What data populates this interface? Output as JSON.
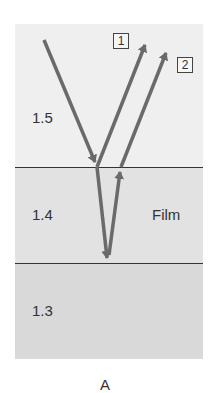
{
  "diagram": {
    "layers": [
      {
        "name": "top-medium",
        "index_label": "1.5",
        "color": "#efefef"
      },
      {
        "name": "film",
        "index_label": "1.4",
        "side_label": "Film",
        "color": "#e2e2e2"
      },
      {
        "name": "bottom-medium",
        "index_label": "1.3",
        "color": "#d9d9d9"
      }
    ],
    "rays": [
      {
        "label": "1"
      },
      {
        "label": "2"
      }
    ],
    "ray_color": "#6a6a6a",
    "caption": "A"
  }
}
